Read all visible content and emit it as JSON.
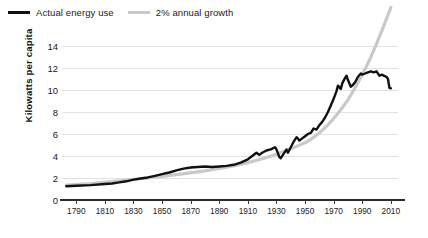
{
  "legend": {
    "position": "top-left",
    "items": [
      {
        "label": "Actual energy use",
        "color": "#111111",
        "icon": "line-swatch-black"
      },
      {
        "label": "2% annual growth",
        "color": "#c9c9c9",
        "icon": "line-swatch-gray"
      }
    ]
  },
  "chart_data": {
    "type": "line",
    "title": "",
    "subtitle": "",
    "xlabel": "",
    "ylabel": "Kilowatts per capita",
    "xlim": [
      1780,
      2015
    ],
    "ylim": [
      0,
      14
    ],
    "grid": true,
    "legend_position": "top-left",
    "xticks": [
      1790,
      1810,
      1830,
      1850,
      1870,
      1890,
      1910,
      1930,
      1950,
      1970,
      1990,
      2010
    ],
    "yticks": [
      0,
      2,
      4,
      6,
      8,
      10,
      12,
      14
    ],
    "series": [
      {
        "name": "Actual energy use",
        "color": "#111111",
        "x": [
          1783,
          1790,
          1800,
          1810,
          1815,
          1820,
          1825,
          1830,
          1835,
          1840,
          1845,
          1850,
          1855,
          1860,
          1865,
          1870,
          1875,
          1880,
          1885,
          1890,
          1895,
          1900,
          1905,
          1910,
          1913,
          1916,
          1918,
          1920,
          1923,
          1926,
          1929,
          1930,
          1932,
          1933,
          1935,
          1937,
          1938,
          1940,
          1942,
          1944,
          1945,
          1946,
          1948,
          1950,
          1952,
          1954,
          1956,
          1958,
          1960,
          1962,
          1964,
          1966,
          1968,
          1970,
          1972,
          1973,
          1975,
          1976,
          1978,
          1979,
          1980,
          1982,
          1983,
          1985,
          1987,
          1989,
          1990,
          1992,
          1994,
          1996,
          1998,
          2000,
          2002,
          2004,
          2005,
          2007,
          2008,
          2009,
          2010
        ],
        "y": [
          1.25,
          1.3,
          1.35,
          1.45,
          1.5,
          1.6,
          1.7,
          1.85,
          1.95,
          2.05,
          2.2,
          2.35,
          2.5,
          2.7,
          2.85,
          2.95,
          3.0,
          3.05,
          3.0,
          3.05,
          3.1,
          3.2,
          3.4,
          3.7,
          4.0,
          4.3,
          4.1,
          4.3,
          4.5,
          4.6,
          4.8,
          4.6,
          3.9,
          3.8,
          4.2,
          4.6,
          4.3,
          4.8,
          5.3,
          5.7,
          5.6,
          5.4,
          5.6,
          5.8,
          6.0,
          6.1,
          6.5,
          6.4,
          6.8,
          7.1,
          7.5,
          8.0,
          8.6,
          9.2,
          9.9,
          10.4,
          10.1,
          10.6,
          11.1,
          11.3,
          10.9,
          10.3,
          10.4,
          10.7,
          11.2,
          11.5,
          11.4,
          11.5,
          11.6,
          11.7,
          11.6,
          11.7,
          11.3,
          11.4,
          11.3,
          11.2,
          11.0,
          10.2,
          10.15
        ]
      },
      {
        "name": "2% annual growth",
        "color": "#c9c9c9",
        "x": [
          1783,
          1800,
          1820,
          1840,
          1860,
          1880,
          1900,
          1910,
          1920,
          1930,
          1940,
          1950,
          1955,
          1960,
          1965,
          1970,
          1975,
          1980,
          1985,
          1990,
          1995,
          2000,
          2005,
          2010
        ],
        "y": [
          1.35,
          1.5,
          1.75,
          2.0,
          2.3,
          2.65,
          3.1,
          3.4,
          3.75,
          4.15,
          4.65,
          5.2,
          5.6,
          6.1,
          6.7,
          7.4,
          8.2,
          9.1,
          10.2,
          11.4,
          12.7,
          14.2,
          15.8,
          17.5
        ]
      }
    ]
  }
}
